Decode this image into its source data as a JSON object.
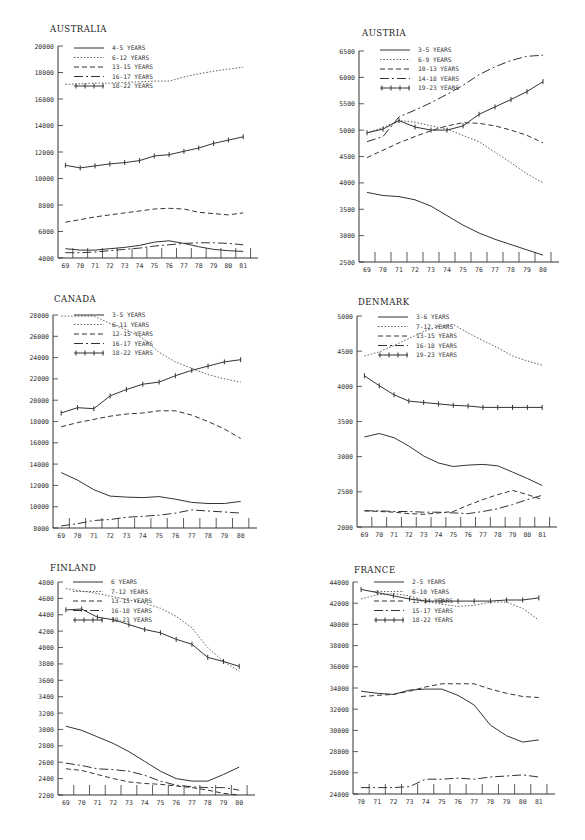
{
  "chart_data": [
    {
      "type": "line",
      "title": "AUSTRALIA",
      "x": [
        "69",
        "70",
        "71",
        "72",
        "73",
        "74",
        "75",
        "76",
        "77",
        "78",
        "79",
        "80",
        "81"
      ],
      "ylim": [
        4000,
        20000
      ],
      "yticks": [
        4000,
        6000,
        8000,
        10000,
        12000,
        14000,
        16000,
        18000,
        20000
      ],
      "series": [
        {
          "name": "4-5 YEARS",
          "style": "solid",
          "values": [
            4700,
            4600,
            4600,
            4700,
            4800,
            4950,
            5200,
            5300,
            5100,
            4850,
            4650,
            4550,
            4500
          ]
        },
        {
          "name": "6-12 YEARS",
          "style": "dotted",
          "values": [
            17100,
            17150,
            17200,
            17200,
            17250,
            17300,
            17350,
            17350,
            17650,
            17900,
            18100,
            18250,
            18400
          ]
        },
        {
          "name": "13-15 YEARS",
          "style": "dashed",
          "values": [
            6700,
            6900,
            7100,
            7250,
            7400,
            7550,
            7700,
            7750,
            7700,
            7450,
            7350,
            7250,
            7400
          ]
        },
        {
          "name": "16-17 YEARS",
          "style": "dashdot",
          "values": [
            4400,
            4400,
            4450,
            4550,
            4650,
            4750,
            4900,
            5000,
            5100,
            5150,
            5150,
            5100,
            5000
          ]
        },
        {
          "name": "18-22 YEARS",
          "style": "marker",
          "values": [
            11000,
            10800,
            10950,
            11100,
            11200,
            11350,
            11700,
            11800,
            12050,
            12300,
            12650,
            12900,
            13150
          ]
        }
      ]
    },
    {
      "type": "line",
      "title": "AUSTRIA",
      "x": [
        "69",
        "70",
        "71",
        "72",
        "73",
        "74",
        "75",
        "76",
        "77",
        "78",
        "79",
        "80"
      ],
      "ylim": [
        2500,
        6500
      ],
      "yticks": [
        2500,
        3000,
        3500,
        4000,
        4500,
        5000,
        5500,
        6000,
        6500
      ],
      "series": [
        {
          "name": "3-5 YEARS",
          "style": "solid",
          "values": [
            3820,
            3760,
            3740,
            3680,
            3560,
            3380,
            3200,
            3050,
            2930,
            2830,
            2730,
            2630
          ]
        },
        {
          "name": "6-9 YEARS",
          "style": "dotted",
          "values": [
            4950,
            5050,
            5180,
            5150,
            5080,
            5020,
            4900,
            4780,
            4580,
            4380,
            4170,
            4000
          ]
        },
        {
          "name": "10-13 YEARS",
          "style": "dashed",
          "values": [
            4480,
            4620,
            4760,
            4880,
            4990,
            5080,
            5140,
            5130,
            5080,
            5000,
            4900,
            4760
          ]
        },
        {
          "name": "14-18 YEARS",
          "style": "dashdot",
          "values": [
            4780,
            4880,
            5250,
            5380,
            5520,
            5680,
            5850,
            6050,
            6200,
            6320,
            6400,
            6420
          ]
        },
        {
          "name": "19-23 YEARS",
          "style": "marker",
          "values": [
            4950,
            5020,
            5180,
            5060,
            5000,
            5000,
            5080,
            5300,
            5440,
            5580,
            5730,
            5920
          ]
        }
      ]
    },
    {
      "type": "line",
      "title": "CANADA",
      "x": [
        "69",
        "70",
        "71",
        "72",
        "73",
        "74",
        "75",
        "76",
        "77",
        "78",
        "79",
        "80"
      ],
      "ylim": [
        8000,
        28000
      ],
      "yticks": [
        8000,
        10000,
        12000,
        14000,
        16000,
        18000,
        20000,
        22000,
        24000,
        26000,
        28000
      ],
      "series": [
        {
          "name": "3-5 YEARS",
          "style": "solid",
          "values": [
            13200,
            12500,
            11600,
            11000,
            10900,
            10850,
            10950,
            10700,
            10400,
            10300,
            10300,
            10500
          ]
        },
        {
          "name": "6-11 YEARS",
          "style": "dotted",
          "values": [
            27900,
            27900,
            27900,
            27200,
            26600,
            25800,
            24500,
            23600,
            23000,
            22400,
            22000,
            21700
          ]
        },
        {
          "name": "12-15 YEARS",
          "style": "dashed",
          "values": [
            17500,
            17900,
            18200,
            18500,
            18700,
            18800,
            19000,
            19000,
            18600,
            18000,
            17300,
            16400
          ]
        },
        {
          "name": "16-17 YEARS",
          "style": "dashdot",
          "values": [
            8200,
            8400,
            8700,
            8800,
            9000,
            9100,
            9200,
            9400,
            9700,
            9600,
            9500,
            9400
          ]
        },
        {
          "name": "18-22 YEARS",
          "style": "marker",
          "values": [
            18800,
            19300,
            19200,
            20400,
            21000,
            21500,
            21700,
            22300,
            22800,
            23200,
            23600,
            23800
          ]
        }
      ]
    },
    {
      "type": "line",
      "title": "DENMARK",
      "x": [
        "69",
        "70",
        "71",
        "72",
        "73",
        "74",
        "75",
        "76",
        "77",
        "78",
        "79",
        "80",
        "81"
      ],
      "ylim": [
        2000,
        5000
      ],
      "yticks": [
        2000,
        2500,
        3000,
        3500,
        4000,
        4500,
        5000
      ],
      "series": [
        {
          "name": "3-6 YEARS",
          "style": "solid",
          "values": [
            3280,
            3330,
            3270,
            3150,
            3010,
            2910,
            2860,
            2880,
            2890,
            2870,
            2780,
            2690,
            2590
          ]
        },
        {
          "name": "7-12 YEARS",
          "style": "dotted",
          "values": [
            4430,
            4490,
            4580,
            4680,
            4780,
            4850,
            4880,
            4760,
            4650,
            4550,
            4430,
            4360,
            4300
          ]
        },
        {
          "name": "13-15 YEARS",
          "style": "dashed",
          "values": [
            2230,
            2220,
            2210,
            2190,
            2180,
            2200,
            2220,
            2310,
            2390,
            2460,
            2520,
            2460,
            2390
          ]
        },
        {
          "name": "16-18 YEARS",
          "style": "dashdot",
          "values": [
            2230,
            2230,
            2220,
            2220,
            2210,
            2210,
            2200,
            2190,
            2220,
            2260,
            2320,
            2390,
            2450
          ]
        },
        {
          "name": "19-23 YEARS",
          "style": "marker",
          "values": [
            4150,
            4010,
            3880,
            3790,
            3770,
            3750,
            3730,
            3720,
            3700,
            3700,
            3700,
            3700,
            3700
          ]
        }
      ]
    },
    {
      "type": "line",
      "title": "FINLAND",
      "x": [
        "69",
        "70",
        "71",
        "72",
        "73",
        "74",
        "75",
        "76",
        "77",
        "78",
        "79",
        "80"
      ],
      "ylim": [
        2200,
        4800
      ],
      "yticks": [
        2200,
        2400,
        2600,
        2800,
        3000,
        3200,
        3400,
        3600,
        3800,
        4000,
        4200,
        4400,
        4600,
        4800
      ],
      "series": [
        {
          "name": "6 YEARS",
          "style": "solid",
          "values": [
            3040,
            2990,
            2910,
            2830,
            2730,
            2610,
            2490,
            2400,
            2370,
            2370,
            2450,
            2540
          ]
        },
        {
          "name": "7-12 YEARS",
          "style": "dotted",
          "values": [
            4720,
            4690,
            4660,
            4620,
            4580,
            4540,
            4480,
            4380,
            4240,
            4000,
            3830,
            3710
          ]
        },
        {
          "name": "13-15 YEARS",
          "style": "dashed",
          "values": [
            2520,
            2500,
            2450,
            2400,
            2360,
            2340,
            2330,
            2310,
            2290,
            2260,
            2220,
            2200
          ]
        },
        {
          "name": "16-18 YEARS",
          "style": "dashdot",
          "values": [
            2590,
            2560,
            2520,
            2510,
            2490,
            2440,
            2370,
            2320,
            2300,
            2290,
            2290,
            2260
          ]
        },
        {
          "name": "19-23 YEARS",
          "style": "marker",
          "values": [
            4460,
            4470,
            4370,
            4340,
            4280,
            4220,
            4180,
            4100,
            4040,
            3880,
            3830,
            3770
          ]
        }
      ]
    },
    {
      "type": "line",
      "title": "FRANCE",
      "x": [
        "70",
        "71",
        "72",
        "73",
        "74",
        "75",
        "76",
        "77",
        "78",
        "79",
        "80",
        "81"
      ],
      "ylim": [
        24000,
        44000
      ],
      "yticks": [
        24000,
        26000,
        28000,
        30000,
        32000,
        34000,
        36000,
        38000,
        40000,
        42000,
        44000
      ],
      "series": [
        {
          "name": "2-5 YEARS",
          "style": "solid",
          "values": [
            33700,
            33500,
            33400,
            33800,
            33900,
            33900,
            33300,
            32400,
            30500,
            29500,
            28900,
            29100
          ]
        },
        {
          "name": "6-10 YEARS",
          "style": "dotted",
          "values": [
            42400,
            42800,
            42900,
            42700,
            42200,
            41900,
            41700,
            41800,
            42100,
            42100,
            41500,
            40400
          ]
        },
        {
          "name": "11-14 YEARS",
          "style": "dashed",
          "values": [
            33200,
            33300,
            33400,
            33700,
            34100,
            34400,
            34400,
            34400,
            33900,
            33500,
            33200,
            33100
          ]
        },
        {
          "name": "15-17 YEARS",
          "style": "dashdot",
          "values": [
            24600,
            24600,
            24600,
            24700,
            25400,
            25400,
            25500,
            25400,
            25600,
            25700,
            25800,
            25600
          ]
        },
        {
          "name": "18-22 YEARS",
          "style": "marker",
          "values": [
            43300,
            43000,
            42700,
            42400,
            42200,
            42200,
            42200,
            42200,
            42200,
            42300,
            42300,
            42500
          ]
        }
      ]
    }
  ],
  "panels": [
    {
      "title": "AUSTRALIA"
    },
    {
      "title": "AUSTRIA"
    },
    {
      "title": "CANADA"
    },
    {
      "title": "DENMARK"
    },
    {
      "title": "FINLAND"
    },
    {
      "title": "FRANCE"
    }
  ]
}
